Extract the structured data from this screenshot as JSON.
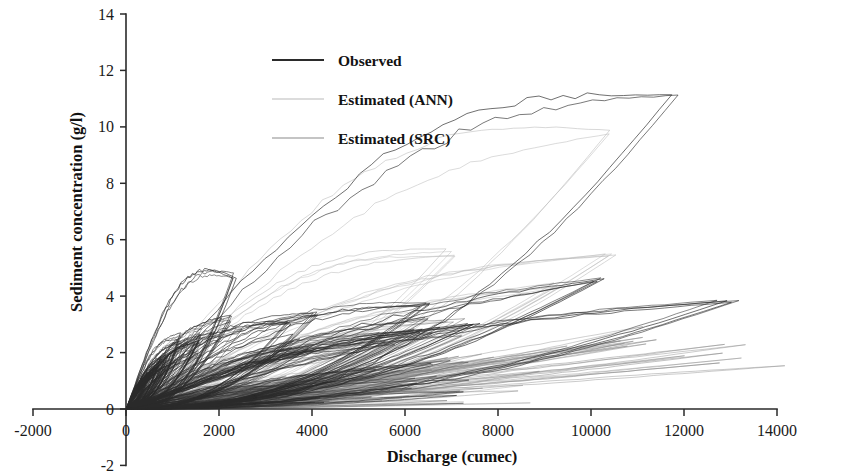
{
  "chart_data": {
    "type": "line",
    "title": "",
    "xlabel": "Discharge (cumec)",
    "ylabel": "Sediment concentration (g/l)",
    "xlim": [
      -2000,
      14000
    ],
    "ylim": [
      -2,
      14
    ],
    "xticks": [
      -2000,
      0,
      2000,
      4000,
      6000,
      8000,
      10000,
      12000,
      14000
    ],
    "yticks": [
      -2,
      0,
      2,
      4,
      6,
      8,
      10,
      12,
      14
    ],
    "xtick_labels": [
      "-2000",
      "0",
      "2000",
      "4000",
      "6000",
      "8000",
      "10000",
      "12000",
      "14000"
    ],
    "ytick_labels": [
      "-2",
      "0",
      "2",
      "4",
      "6",
      "8",
      "10",
      "12",
      "14"
    ],
    "grid": false,
    "legend_position": "upper-center-left",
    "series": [
      {
        "name": "Observed",
        "color": "#2b2b2b",
        "style": "solid",
        "width": 0.85,
        "description": "Hysteresis loops of observed sediment concentration vs discharge; largest loop peaks near (11800, 11.2)",
        "loops": [
          {
            "xpeak": 11800,
            "ypeak": 11.2,
            "yfall": 5.6,
            "bulge": 0.58,
            "n": 1
          },
          {
            "xpeak": 12950,
            "ypeak": 3.85,
            "yfall": 2.9,
            "bulge": 0.42,
            "n": 1
          },
          {
            "xpeak": 10050,
            "ypeak": 4.55,
            "yfall": 2.45,
            "bulge": 0.3,
            "n": 1
          },
          {
            "xpeak": 7450,
            "ypeak": 3.05,
            "yfall": 1.65,
            "bulge": 0.34,
            "n": 1
          },
          {
            "xpeak": 6900,
            "ypeak": 2.95,
            "yfall": 1.3,
            "bulge": 0.4,
            "n": 1
          },
          {
            "xpeak": 6450,
            "ypeak": 3.7,
            "yfall": 1.55,
            "bulge": 0.5,
            "n": 1
          },
          {
            "xpeak": 5900,
            "ypeak": 2.6,
            "yfall": 1.1,
            "bulge": 0.36,
            "n": 1
          },
          {
            "xpeak": 4100,
            "ypeak": 3.35,
            "yfall": 1.4,
            "bulge": 0.46,
            "n": 1
          },
          {
            "xpeak": 3850,
            "ypeak": 2.4,
            "yfall": 1.05,
            "bulge": 0.3,
            "n": 1
          },
          {
            "xpeak": 3500,
            "ypeak": 3.1,
            "yfall": 1.2,
            "bulge": 0.52,
            "n": 1
          },
          {
            "xpeak": 2350,
            "ypeak": 4.7,
            "yfall": 1.6,
            "bulge": 0.62,
            "n": 1
          },
          {
            "xpeak": 2250,
            "ypeak": 3.0,
            "yfall": 1.1,
            "bulge": 0.44,
            "n": 1
          },
          {
            "xpeak": 1750,
            "ypeak": 2.6,
            "yfall": 1.0,
            "bulge": 0.4,
            "n": 1
          },
          {
            "xpeak": 1500,
            "ypeak": 2.15,
            "yfall": 0.9,
            "bulge": 0.36,
            "n": 1
          },
          {
            "xpeak": 1250,
            "ypeak": 2.35,
            "yfall": 0.85,
            "bulge": 0.48,
            "n": 1
          },
          {
            "xpeak": 1050,
            "ypeak": 1.95,
            "yfall": 0.75,
            "bulge": 0.34,
            "n": 1
          },
          {
            "xpeak": 900,
            "ypeak": 1.8,
            "yfall": 0.7,
            "bulge": 0.4,
            "n": 1
          },
          {
            "xpeak": 780,
            "ypeak": 1.6,
            "yfall": 0.62,
            "bulge": 0.32,
            "n": 1
          },
          {
            "xpeak": 650,
            "ypeak": 1.45,
            "yfall": 0.55,
            "bulge": 0.38,
            "n": 1
          },
          {
            "xpeak": 560,
            "ypeak": 1.3,
            "yfall": 0.5,
            "bulge": 0.3,
            "n": 1
          },
          {
            "xpeak": 470,
            "ypeak": 1.15,
            "yfall": 0.45,
            "bulge": 0.36,
            "n": 1
          },
          {
            "xpeak": 400,
            "ypeak": 1.0,
            "yfall": 0.4,
            "bulge": 0.28,
            "n": 1
          }
        ]
      },
      {
        "name": "Estimated (ANN)",
        "color": "#b9b9b9",
        "style": "solid",
        "width": 0.7,
        "description": "ANN-estimated loops, lighter and broadly following observed; main loop peaks near (10300, 9.7)",
        "loops": [
          {
            "xpeak": 10300,
            "ypeak": 9.7,
            "yfall": 4.9,
            "bulge": 0.52,
            "n": 1
          },
          {
            "xpeak": 10450,
            "ypeak": 5.45,
            "yfall": 2.6,
            "bulge": 0.44,
            "n": 1
          },
          {
            "xpeak": 9200,
            "ypeak": 4.4,
            "yfall": 2.1,
            "bulge": 0.38,
            "n": 1
          },
          {
            "xpeak": 7000,
            "ypeak": 5.55,
            "yfall": 1.9,
            "bulge": 0.56,
            "n": 1
          },
          {
            "xpeak": 6600,
            "ypeak": 2.85,
            "yfall": 1.25,
            "bulge": 0.34,
            "n": 1
          },
          {
            "xpeak": 5200,
            "ypeak": 2.3,
            "yfall": 1.05,
            "bulge": 0.3,
            "n": 1
          },
          {
            "xpeak": 4000,
            "ypeak": 2.1,
            "yfall": 0.95,
            "bulge": 0.36,
            "n": 1
          },
          {
            "xpeak": 3200,
            "ypeak": 1.9,
            "yfall": 0.8,
            "bulge": 0.32,
            "n": 1
          },
          {
            "xpeak": 2400,
            "ypeak": 1.7,
            "yfall": 0.72,
            "bulge": 0.3,
            "n": 1
          },
          {
            "xpeak": 1800,
            "ypeak": 1.45,
            "yfall": 0.62,
            "bulge": 0.34,
            "n": 1
          },
          {
            "xpeak": 1300,
            "ypeak": 1.25,
            "yfall": 0.54,
            "bulge": 0.3,
            "n": 1
          },
          {
            "xpeak": 950,
            "ypeak": 1.05,
            "yfall": 0.46,
            "bulge": 0.28,
            "n": 1
          },
          {
            "xpeak": 700,
            "ypeak": 0.9,
            "yfall": 0.38,
            "bulge": 0.26,
            "n": 1
          },
          {
            "xpeak": 520,
            "ypeak": 0.75,
            "yfall": 0.32,
            "bulge": 0.24,
            "n": 1
          }
        ]
      },
      {
        "name": "Estimated (SRC)",
        "color": "#8a8a8a",
        "style": "solid",
        "width": 0.7,
        "description": "Sediment rating curve estimates, near monotonic, flattest band reaching about (13000, 1.75)",
        "loops": [
          {
            "xpeak": 13000,
            "ypeak": 1.75,
            "yfall": 1.72,
            "bulge": 0.04,
            "n": 1
          },
          {
            "xpeak": 12100,
            "ypeak": 2.55,
            "yfall": 2.4,
            "bulge": 0.08,
            "n": 1
          },
          {
            "xpeak": 10400,
            "ypeak": 2.2,
            "yfall": 2.05,
            "bulge": 0.08,
            "n": 1
          },
          {
            "xpeak": 8700,
            "ypeak": 1.95,
            "yfall": 1.8,
            "bulge": 0.08,
            "n": 1
          },
          {
            "xpeak": 7300,
            "ypeak": 1.7,
            "yfall": 1.55,
            "bulge": 0.09,
            "n": 1
          },
          {
            "xpeak": 6100,
            "ypeak": 1.5,
            "yfall": 1.35,
            "bulge": 0.09,
            "n": 1
          },
          {
            "xpeak": 4900,
            "ypeak": 1.3,
            "yfall": 1.15,
            "bulge": 0.1,
            "n": 1
          },
          {
            "xpeak": 3800,
            "ypeak": 1.1,
            "yfall": 0.98,
            "bulge": 0.1,
            "n": 1
          },
          {
            "xpeak": 2900,
            "ypeak": 0.95,
            "yfall": 0.84,
            "bulge": 0.1,
            "n": 1
          },
          {
            "xpeak": 2100,
            "ypeak": 0.8,
            "yfall": 0.7,
            "bulge": 0.11,
            "n": 1
          },
          {
            "xpeak": 1500,
            "ypeak": 0.66,
            "yfall": 0.57,
            "bulge": 0.11,
            "n": 1
          },
          {
            "xpeak": 1000,
            "ypeak": 0.52,
            "yfall": 0.45,
            "bulge": 0.11,
            "n": 1
          },
          {
            "xpeak": 650,
            "ypeak": 0.4,
            "yfall": 0.34,
            "bulge": 0.11,
            "n": 1
          }
        ]
      }
    ]
  },
  "legend": {
    "items": [
      {
        "label": "Observed",
        "key": "observed"
      },
      {
        "label": "Estimated (ANN)",
        "key": "ann"
      },
      {
        "label": "Estimated (SRC)",
        "key": "src"
      }
    ]
  },
  "colors": {
    "observed": "#2b2b2b",
    "ann": "#b9b9b9",
    "src": "#8a8a8a",
    "axis": "#2a2a2a",
    "text": "#111111",
    "background": "#ffffff"
  }
}
